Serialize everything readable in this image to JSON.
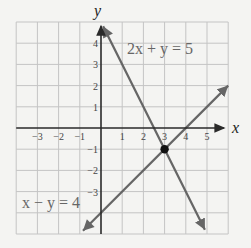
{
  "chart_data": {
    "type": "line",
    "title": "",
    "xlabel": "x",
    "ylabel": "y",
    "xlim": [
      -4,
      6
    ],
    "ylim": [
      -5,
      5
    ],
    "grid": true,
    "x_ticks": [
      -3,
      -2,
      -1,
      1,
      2,
      3,
      4,
      5
    ],
    "y_ticks": [
      4,
      3,
      2,
      1,
      -1,
      -2,
      -3
    ],
    "series": [
      {
        "name": "2x + y = 5",
        "label": "2x + y = 5",
        "slope": -2,
        "intercept": 5,
        "x_range": [
          0.1,
          4.9
        ],
        "label_pos": "top-right"
      },
      {
        "name": "x − y = 4",
        "label": "x − y = 4",
        "slope": 1,
        "intercept": -4,
        "x_range": [
          -0.85,
          6
        ],
        "label_pos": "bottom-left"
      }
    ],
    "points": [
      {
        "name": "intersection",
        "x": 3,
        "y": -1
      }
    ],
    "colors": {
      "lines": "#666666",
      "axes": "#2a2a2a",
      "grid": "#c4c4c4",
      "point": "#111111"
    }
  }
}
